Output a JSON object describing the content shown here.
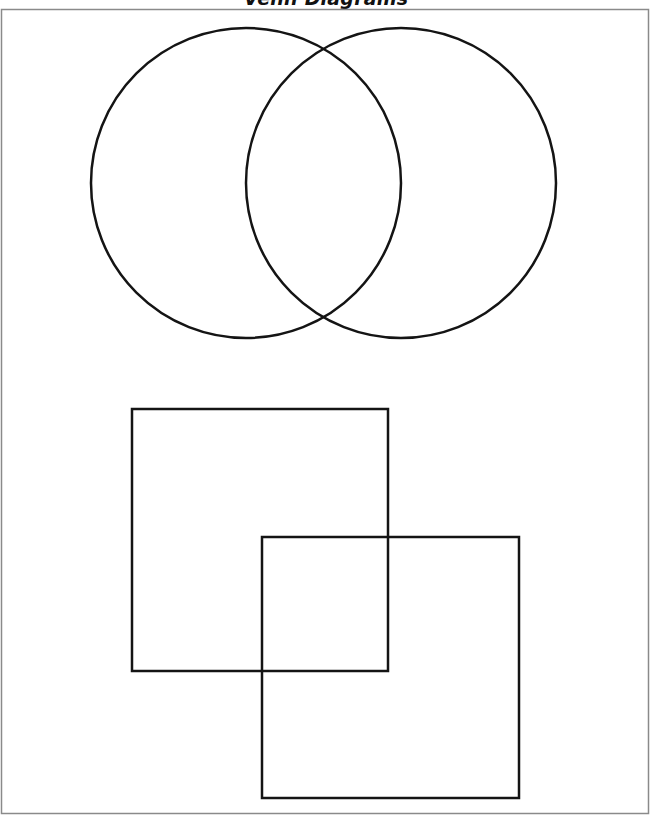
{
  "page": {
    "title": "Venn Diagrams",
    "border_color": "#8a8a8a",
    "stroke_color": "#141414"
  },
  "diagrams": {
    "circles": [
      {
        "name": "left-circle",
        "cx": 246,
        "cy": 183,
        "r": 155
      },
      {
        "name": "right-circle",
        "cx": 401,
        "cy": 183,
        "r": 155
      }
    ],
    "squares": [
      {
        "name": "top-left-square",
        "x": 132,
        "y": 409,
        "width": 256,
        "height": 262
      },
      {
        "name": "bottom-right-square",
        "x": 262,
        "y": 537,
        "width": 257,
        "height": 261
      }
    ]
  }
}
